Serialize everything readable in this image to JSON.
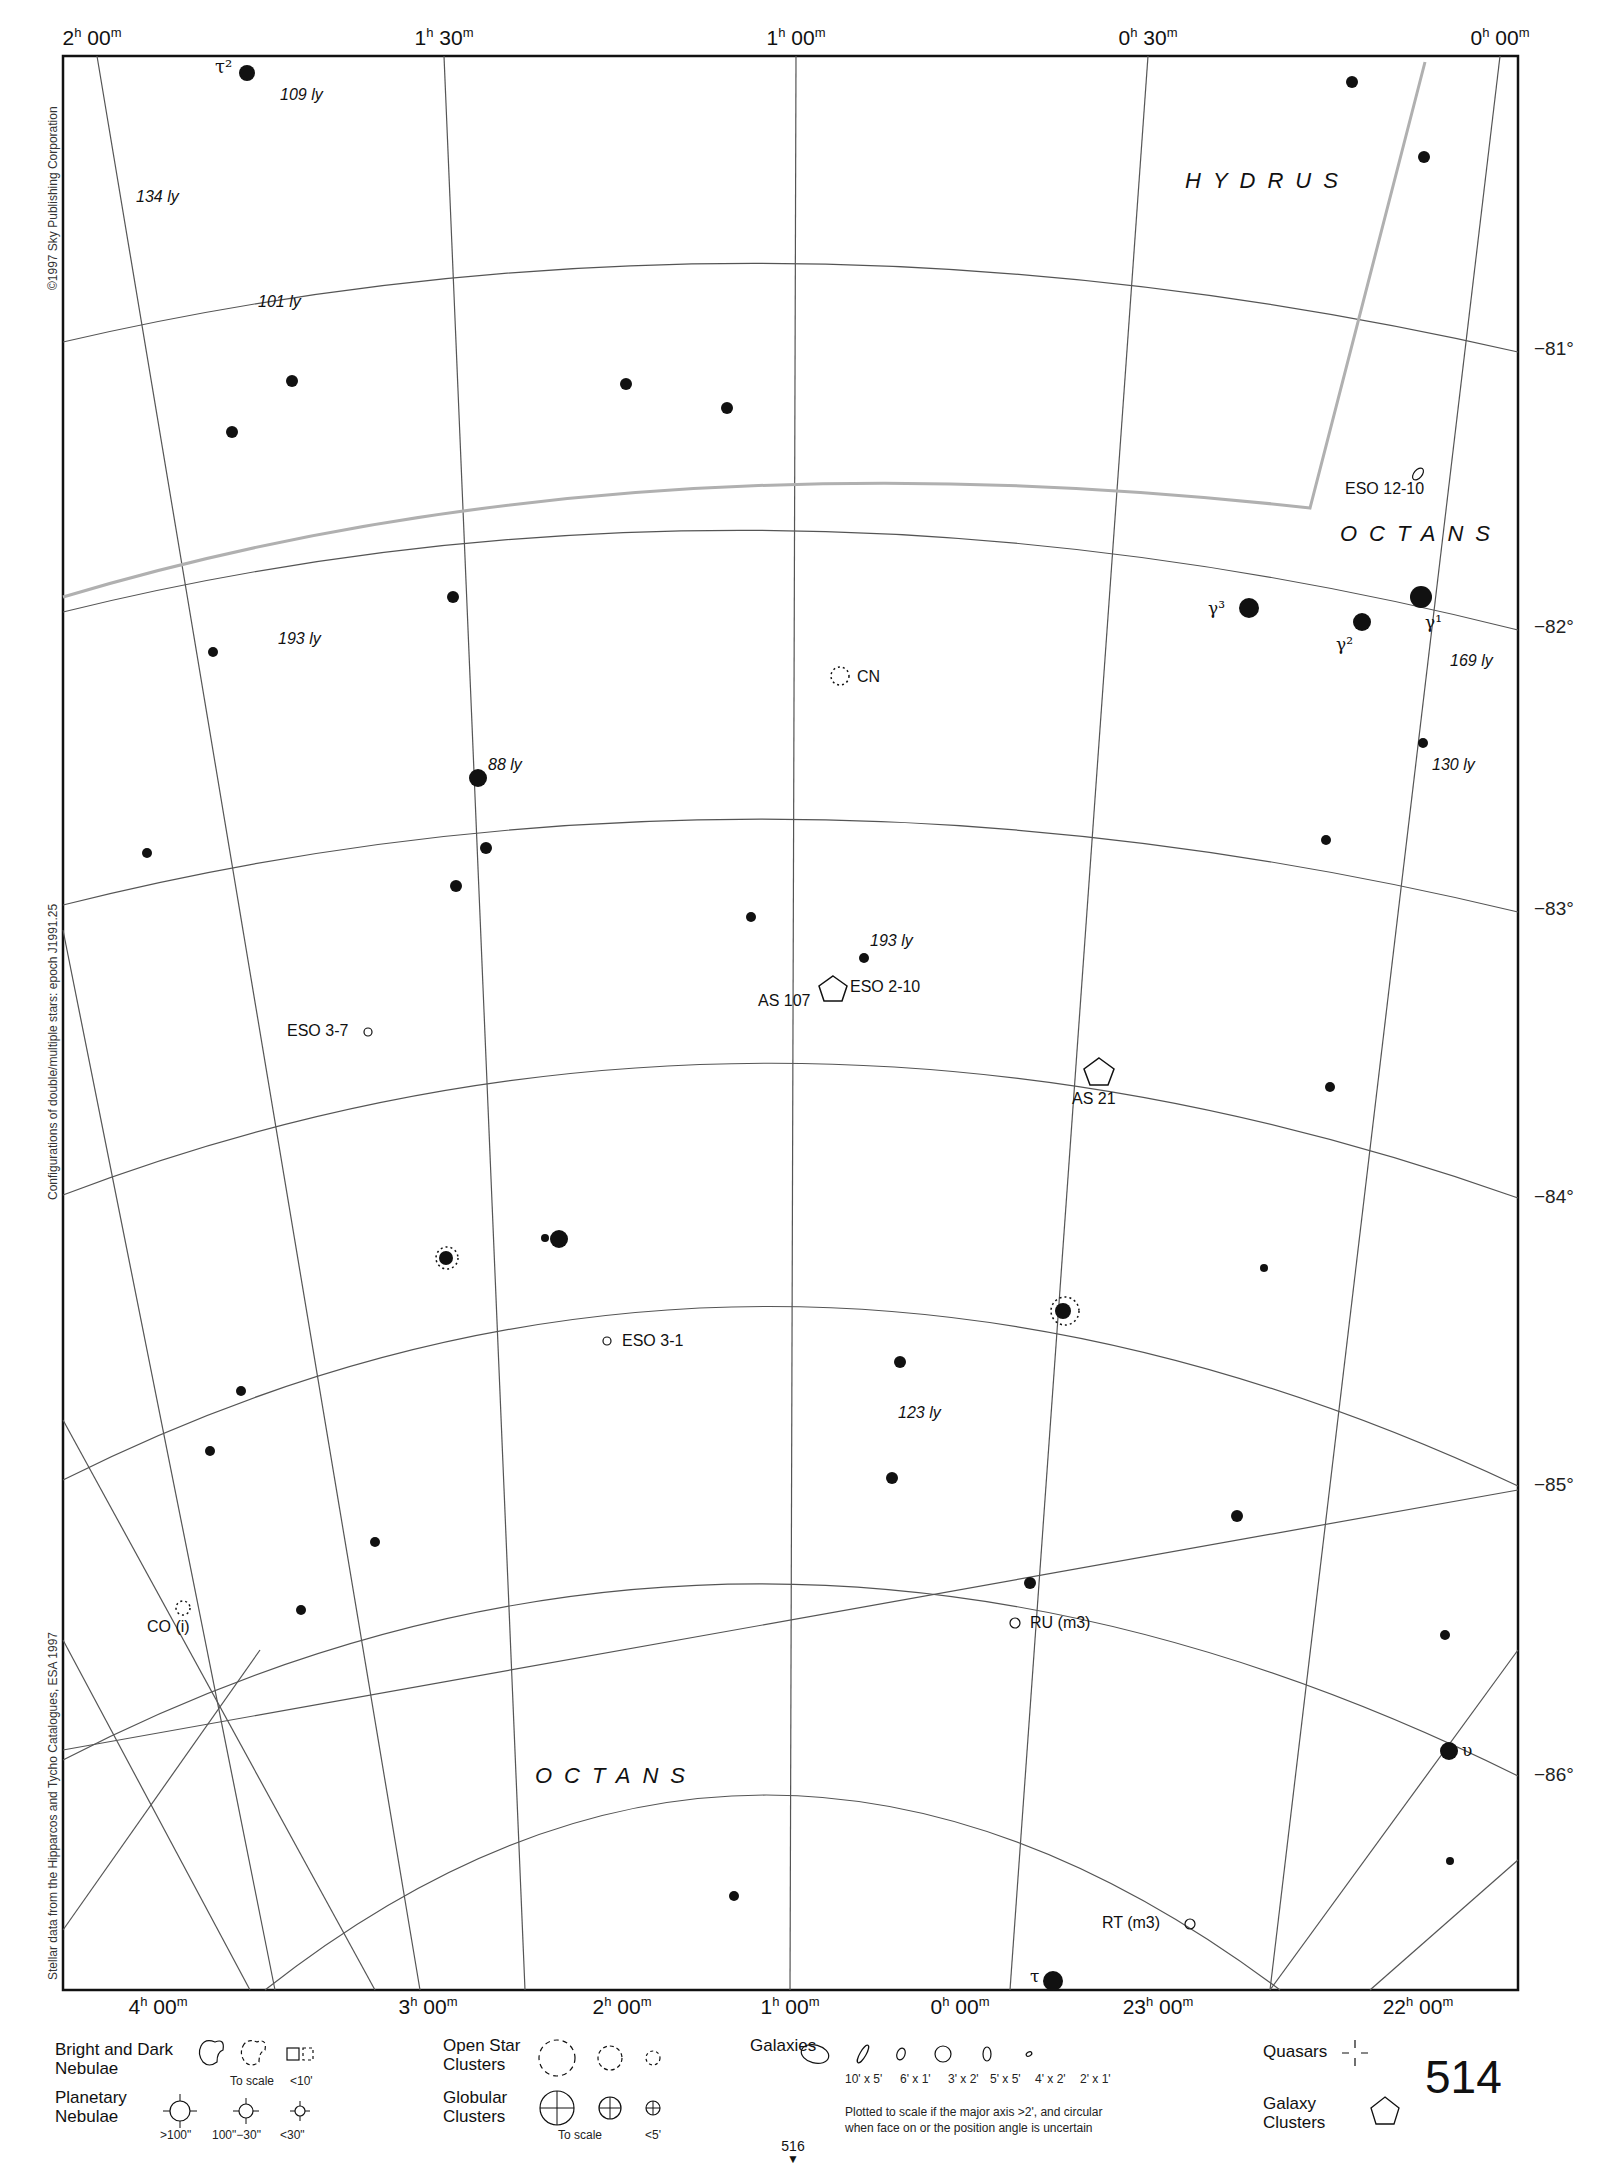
{
  "page": {
    "number": "514",
    "next_page": "516"
  },
  "ra_labels_top": [
    {
      "h": "2",
      "m": "00",
      "x": 92
    },
    {
      "h": "1",
      "m": "30",
      "x": 444
    },
    {
      "h": "1",
      "m": "00",
      "x": 796
    },
    {
      "h": "0",
      "m": "30",
      "x": 1148
    },
    {
      "h": "0",
      "m": "00",
      "x": 1500
    }
  ],
  "ra_labels_bottom": [
    {
      "h": "4",
      "m": "00",
      "x": 158
    },
    {
      "h": "3",
      "m": "00",
      "x": 428
    },
    {
      "h": "2",
      "m": "00",
      "x": 622
    },
    {
      "h": "1",
      "m": "00",
      "x": 790
    },
    {
      "h": "0",
      "m": "00",
      "x": 960
    },
    {
      "h": "23",
      "m": "00",
      "x": 1158
    },
    {
      "h": "22",
      "m": "00",
      "x": 1418
    }
  ],
  "dec_labels": [
    {
      "text": "−81°",
      "y": 350
    },
    {
      "text": "−82°",
      "y": 628
    },
    {
      "text": "−83°",
      "y": 910
    },
    {
      "text": "−84°",
      "y": 1198
    },
    {
      "text": "−85°",
      "y": 1486
    },
    {
      "text": "−86°",
      "y": 1776
    }
  ],
  "credits": {
    "copyright": "©1997 Sky Publishing Corporation",
    "epoch": "Configurations of double/multiple stars: epoch J1991.25",
    "source": "Stellar data from the Hipparcos and Tycho Catalogues, ESA 1997"
  },
  "constellations": [
    {
      "name": "HYDRUS",
      "x": 1185,
      "y": 180
    },
    {
      "name": "OCTANS",
      "x": 1340,
      "y": 534
    },
    {
      "name": "OCTANS",
      "x": 535,
      "y": 1775
    }
  ],
  "star_labels": [
    {
      "text": "τ²",
      "x": 215,
      "y": 70,
      "greek": true
    },
    {
      "text": "109 ly",
      "x": 180,
      "y": 98,
      "italic": true
    },
    {
      "text": "134 ly",
      "x": 132,
      "y": 200,
      "italic": true
    },
    {
      "text": "101 ly",
      "x": 258,
      "y": 305,
      "italic": true
    },
    {
      "text": "193 ly",
      "x": 278,
      "y": 645,
      "italic": true
    },
    {
      "text": "88 ly",
      "x": 488,
      "y": 770,
      "italic": true
    },
    {
      "text": "γ³",
      "x": 1208,
      "y": 612,
      "greek": true
    },
    {
      "text": "γ²",
      "x": 1336,
      "y": 648,
      "greek": true
    },
    {
      "text": "γ¹",
      "x": 1425,
      "y": 628,
      "greek": true
    },
    {
      "text": "169 ly",
      "x": 1450,
      "y": 665,
      "italic": true
    },
    {
      "text": "130 ly",
      "x": 1432,
      "y": 770,
      "italic": true
    },
    {
      "text": "193 ly",
      "x": 870,
      "y": 946,
      "italic": true
    },
    {
      "text": "123 ly",
      "x": 898,
      "y": 1418,
      "italic": true
    },
    {
      "text": "υ",
      "x": 1448,
      "y": 1755,
      "greek": true
    },
    {
      "text": "τ",
      "x": 1028,
      "y": 1983,
      "greek": true
    }
  ],
  "objects": [
    {
      "text": "ESO 12-10",
      "kind": "galaxy",
      "x": 1345,
      "y": 496
    },
    {
      "text": "CN",
      "kind": "variable-star",
      "x": 857,
      "y": 681
    },
    {
      "text": "ESO 2-10",
      "kind": "galaxy",
      "x": 850,
      "y": 991
    },
    {
      "text": "AS 107",
      "kind": "galaxy-cluster",
      "x": 758,
      "y": 1005
    },
    {
      "text": "AS 21",
      "kind": "galaxy-cluster",
      "x": 1072,
      "y": 1087
    },
    {
      "text": "ESO 3-7",
      "kind": "galaxy",
      "x": 287,
      "y": 1035
    },
    {
      "text": "ESO 3-1",
      "kind": "galaxy",
      "x": 622,
      "y": 1344
    },
    {
      "text": "CO (i)",
      "kind": "variable-star",
      "x": 147,
      "y": 1630
    },
    {
      "text": "RU (m3)",
      "kind": "variable-star",
      "x": 1030,
      "y": 1626
    },
    {
      "text": "RT (m3)",
      "kind": "variable-star",
      "x": 1102,
      "y": 1926
    }
  ],
  "legend": {
    "nebulae": {
      "title": "Bright and Dark\nNebulae",
      "captions": [
        "To scale",
        "<10'"
      ]
    },
    "planetary": {
      "title": "Planetary\nNebulae",
      "captions": [
        ">100\"",
        "100\"−30\"",
        "<30\""
      ]
    },
    "open_clusters": {
      "title": "Open Star\nClusters"
    },
    "globular": {
      "title": "Globular\nClusters",
      "captions": [
        "To scale",
        "<5'"
      ]
    },
    "galaxies": {
      "title": "Galaxies",
      "sizes": [
        "10' x 5'",
        "6' x 1'",
        "3' x 2'",
        "5' x 5'",
        "4' x 2'",
        "2' x 1'"
      ],
      "note": "Plotted to scale if the major axis >2', and circular\nwhen face on or the position angle is uncertain"
    },
    "quasars": {
      "title": "Quasars"
    },
    "galaxy_clusters": {
      "title": "Galaxy\nClusters"
    }
  },
  "colors": {
    "ink": "#111111",
    "grid": "#555555",
    "boundary": "#b0b0b0",
    "paper": "#ffffff"
  }
}
